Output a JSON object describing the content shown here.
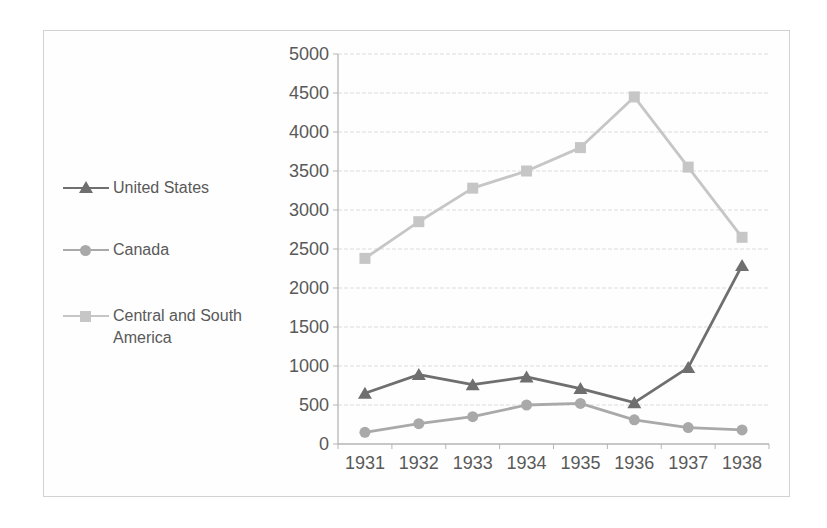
{
  "figure": {
    "background": "#fefefe",
    "frame_border_color": "#d2d2d2",
    "gridline_color": "#dcdcdc",
    "axis_color": "#b5b5b5",
    "text_color": "#595959"
  },
  "chart_data": {
    "type": "line",
    "title": "",
    "xlabel": "",
    "ylabel": "",
    "x_categories": [
      "1931",
      "1932",
      "1933",
      "1934",
      "1935",
      "1936",
      "1937",
      "1938"
    ],
    "series": [
      {
        "name": "United States",
        "marker": "triangle",
        "color": "#6f6f6f",
        "values": [
          650,
          890,
          760,
          860,
          710,
          530,
          980,
          2290
        ]
      },
      {
        "name": "Canada",
        "marker": "circle",
        "color": "#a9a9a9",
        "values": [
          150,
          260,
          350,
          500,
          520,
          310,
          210,
          180
        ]
      },
      {
        "name": "Central and South America",
        "marker": "square",
        "color": "#c6c6c6",
        "values": [
          2380,
          2850,
          3280,
          3500,
          3800,
          4450,
          3550,
          2650
        ]
      }
    ],
    "ylim": [
      0,
      5000
    ],
    "ytick_step": 500,
    "ytick_labels": [
      "0",
      "500",
      "1000",
      "1500",
      "2000",
      "2500",
      "3000",
      "3500",
      "4000",
      "4500",
      "5000"
    ],
    "grid": true,
    "legend_position": "left"
  }
}
